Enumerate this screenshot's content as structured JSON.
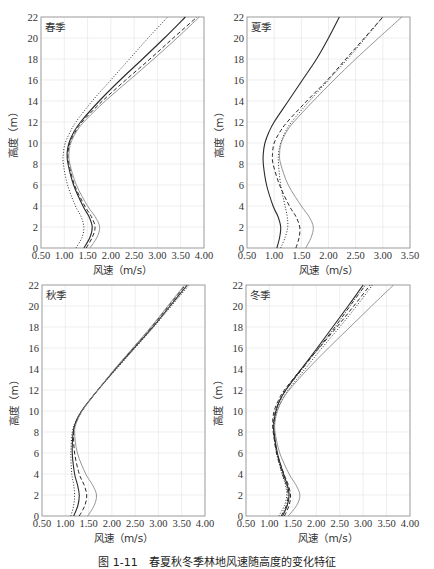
{
  "caption": "图 1-11　春夏秋冬季林地风速随高度的变化特征",
  "colors": {
    "axis": "#9a9a9a",
    "grid": "#e6e6e6",
    "dark_line": "#2a2a2a",
    "light_line": "#8a8a8a",
    "text": "#333333"
  },
  "chart_data": [
    {
      "type": "line",
      "title": "春季",
      "xlabel": "风速（m/s）",
      "ylabel": "高度（m）",
      "xlim": [
        0.5,
        4.0
      ],
      "ylim": [
        0,
        22
      ],
      "xticks": [
        "0.50",
        "1.00",
        "1.50",
        "2.00",
        "2.50",
        "3.00",
        "3.50",
        "4.00"
      ],
      "yticks": [
        "0",
        "2",
        "4",
        "6",
        "8",
        "10",
        "12",
        "14",
        "16",
        "18",
        "20",
        "22"
      ],
      "grid": true,
      "y": [
        0,
        1,
        2,
        3,
        4,
        6,
        8,
        9,
        10,
        11,
        12,
        14,
        16,
        18,
        20,
        22
      ],
      "series": [
        {
          "name": "series-dotted",
          "style": "dotted",
          "values": [
            1.25,
            1.38,
            1.42,
            1.36,
            1.24,
            1.07,
            0.98,
            0.98,
            1.02,
            1.12,
            1.25,
            1.6,
            2.0,
            2.4,
            2.8,
            3.22
          ]
        },
        {
          "name": "series-solid-dark",
          "style": "solid-dark",
          "values": [
            1.42,
            1.55,
            1.6,
            1.53,
            1.4,
            1.2,
            1.08,
            1.06,
            1.1,
            1.2,
            1.35,
            1.75,
            2.2,
            2.68,
            3.15,
            3.6
          ]
        },
        {
          "name": "series-dashed",
          "style": "dashed",
          "values": [
            1.47,
            1.6,
            1.66,
            1.58,
            1.44,
            1.22,
            1.1,
            1.08,
            1.12,
            1.23,
            1.38,
            1.82,
            2.32,
            2.84,
            3.34,
            3.85
          ]
        },
        {
          "name": "series-solid-light",
          "style": "solid-light",
          "values": [
            1.55,
            1.7,
            1.76,
            1.66,
            1.5,
            1.26,
            1.12,
            1.1,
            1.14,
            1.25,
            1.42,
            1.88,
            2.4,
            2.92,
            3.42,
            3.9
          ]
        }
      ]
    },
    {
      "type": "line",
      "title": "夏季",
      "xlabel": "风速（m/s）",
      "ylabel": "高度（m）",
      "xlim": [
        0.5,
        3.5
      ],
      "ylim": [
        0,
        22
      ],
      "xticks": [
        "0.50",
        "1.00",
        "1.50",
        "2.00",
        "2.50",
        "3.00",
        "3.50"
      ],
      "yticks": [
        "0",
        "2",
        "4",
        "6",
        "8",
        "10",
        "12",
        "14",
        "16",
        "18",
        "20",
        "22"
      ],
      "grid": true,
      "y": [
        0,
        1,
        2,
        3,
        4,
        6,
        8,
        9,
        10,
        11,
        12,
        14,
        16,
        18,
        20,
        22
      ],
      "series": [
        {
          "name": "series-solid-dark",
          "style": "solid-dark",
          "values": [
            1.05,
            1.1,
            1.12,
            1.07,
            0.98,
            0.86,
            0.8,
            0.8,
            0.83,
            0.9,
            1.0,
            1.26,
            1.52,
            1.78,
            2.0,
            2.2
          ]
        },
        {
          "name": "series-dotted",
          "style": "dotted",
          "values": [
            1.12,
            1.2,
            1.25,
            1.24,
            1.2,
            1.12,
            1.08,
            1.08,
            1.12,
            1.2,
            1.32,
            1.65,
            2.0,
            2.35,
            2.68,
            3.0
          ]
        },
        {
          "name": "series-dashed",
          "style": "dashed",
          "values": [
            1.4,
            1.46,
            1.47,
            1.4,
            1.28,
            1.1,
            0.98,
            0.97,
            1.0,
            1.1,
            1.24,
            1.6,
            1.98,
            2.32,
            2.66,
            3.0
          ]
        },
        {
          "name": "series-solid-light",
          "style": "solid-light",
          "values": [
            1.58,
            1.68,
            1.72,
            1.64,
            1.5,
            1.26,
            1.12,
            1.1,
            1.13,
            1.22,
            1.36,
            1.72,
            2.1,
            2.5,
            2.92,
            3.35
          ]
        }
      ]
    },
    {
      "type": "line",
      "title": "秋季",
      "xlabel": "风速（m/s）",
      "ylabel": "高度（m）",
      "xlim": [
        0.5,
        4.0
      ],
      "ylim": [
        0,
        22
      ],
      "xticks": [
        "0.50",
        "1.00",
        "1.50",
        "2.00",
        "2.50",
        "3.00",
        "3.50",
        "4.00"
      ],
      "yticks": [
        "0",
        "2",
        "4",
        "6",
        "8",
        "10",
        "12",
        "14",
        "16",
        "18",
        "20",
        "22"
      ],
      "grid": true,
      "y": [
        0,
        1,
        2,
        3,
        4,
        6,
        8,
        9,
        10,
        11,
        12,
        14,
        16,
        18,
        20,
        22
      ],
      "series": [
        {
          "name": "series-dotted",
          "style": "dotted",
          "values": [
            1.12,
            1.18,
            1.2,
            1.18,
            1.14,
            1.12,
            1.15,
            1.22,
            1.35,
            1.52,
            1.7,
            2.1,
            2.5,
            2.9,
            3.28,
            3.66
          ]
        },
        {
          "name": "series-solid-dark",
          "style": "solid-dark",
          "values": [
            1.18,
            1.27,
            1.3,
            1.26,
            1.2,
            1.15,
            1.17,
            1.23,
            1.35,
            1.52,
            1.7,
            2.08,
            2.48,
            2.88,
            3.25,
            3.62
          ]
        },
        {
          "name": "series-dashed",
          "style": "dashed",
          "values": [
            1.3,
            1.42,
            1.46,
            1.4,
            1.3,
            1.2,
            1.18,
            1.24,
            1.36,
            1.52,
            1.7,
            2.07,
            2.46,
            2.85,
            3.22,
            3.58
          ]
        },
        {
          "name": "series-solid-light",
          "style": "solid-light",
          "values": [
            1.48,
            1.62,
            1.67,
            1.58,
            1.44,
            1.26,
            1.2,
            1.25,
            1.36,
            1.52,
            1.7,
            2.06,
            2.45,
            2.84,
            3.2,
            3.56
          ]
        }
      ]
    },
    {
      "type": "line",
      "title": "冬季",
      "xlabel": "风速（m/s）",
      "ylabel": "高度（m）",
      "xlim": [
        0.5,
        4.0
      ],
      "ylim": [
        0,
        22
      ],
      "xticks": [
        "0.50",
        "1.00",
        "1.50",
        "2.00",
        "2.50",
        "3.00",
        "3.50",
        "4.00"
      ],
      "yticks": [
        "0",
        "2",
        "4",
        "6",
        "8",
        "10",
        "12",
        "14",
        "16",
        "18",
        "20",
        "22"
      ],
      "grid": true,
      "y": [
        0,
        1,
        2,
        3,
        4,
        6,
        8,
        9,
        10,
        11,
        12,
        14,
        16,
        18,
        20,
        22
      ],
      "series": [
        {
          "name": "series-solid-dark",
          "style": "solid-dark",
          "values": [
            1.28,
            1.38,
            1.42,
            1.38,
            1.3,
            1.17,
            1.1,
            1.1,
            1.14,
            1.22,
            1.35,
            1.68,
            2.02,
            2.35,
            2.68,
            3.0
          ]
        },
        {
          "name": "series-dash-dot",
          "style": "dashdot",
          "values": [
            1.25,
            1.36,
            1.4,
            1.36,
            1.28,
            1.15,
            1.09,
            1.09,
            1.13,
            1.22,
            1.35,
            1.7,
            2.05,
            2.4,
            2.72,
            3.05
          ]
        },
        {
          "name": "series-dashed",
          "style": "dashed",
          "values": [
            1.32,
            1.42,
            1.45,
            1.4,
            1.31,
            1.16,
            1.08,
            1.07,
            1.1,
            1.19,
            1.32,
            1.68,
            2.06,
            2.44,
            2.8,
            3.15
          ]
        },
        {
          "name": "series-dotted",
          "style": "dotted",
          "values": [
            1.2,
            1.32,
            1.37,
            1.34,
            1.27,
            1.16,
            1.1,
            1.11,
            1.16,
            1.26,
            1.4,
            1.76,
            2.12,
            2.5,
            2.86,
            3.2
          ]
        },
        {
          "name": "series-solid-light",
          "style": "solid-light",
          "values": [
            1.4,
            1.58,
            1.65,
            1.56,
            1.42,
            1.22,
            1.12,
            1.12,
            1.17,
            1.27,
            1.42,
            1.82,
            2.26,
            2.72,
            3.18,
            3.65
          ]
        }
      ]
    }
  ]
}
